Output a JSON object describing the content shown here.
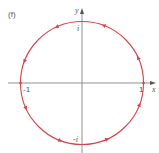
{
  "figure": {
    "panel_label": "(f)",
    "axes": {
      "x_label": "x",
      "y_label": "y"
    },
    "tick_labels": {
      "pos_one": "1",
      "neg_one": "-1",
      "pos_i": "i",
      "neg_i": "-i"
    },
    "curve": {
      "type": "unit-circle",
      "color": "#d8404a",
      "direction_markers": 8
    },
    "axis_color": "#666666"
  }
}
